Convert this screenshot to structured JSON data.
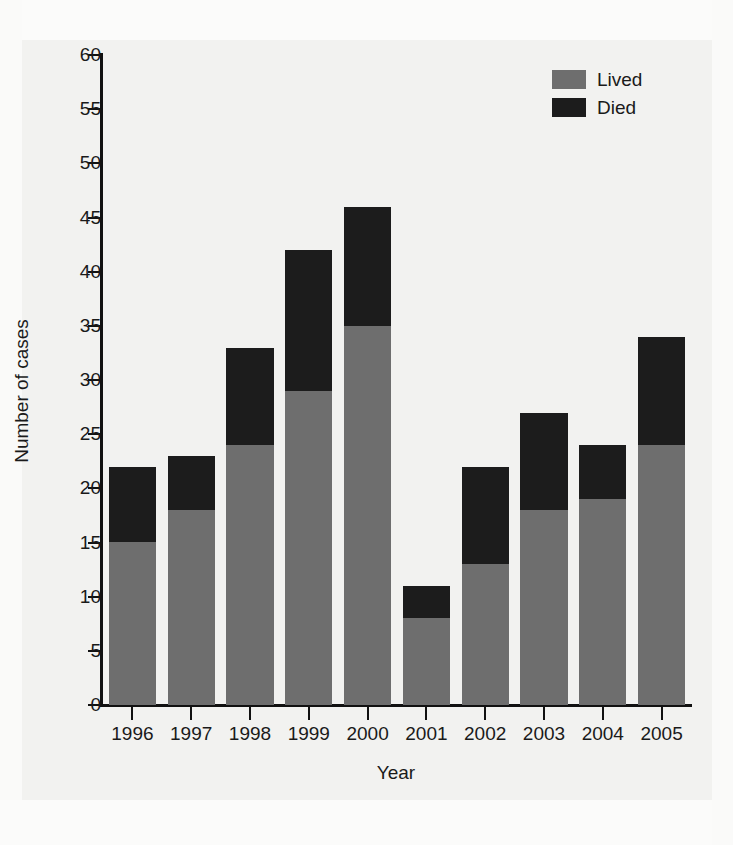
{
  "chart_data": {
    "type": "bar",
    "stacked": true,
    "title": "",
    "xlabel": "Year",
    "ylabel": "Number of cases",
    "categories": [
      "1996",
      "1997",
      "1998",
      "1999",
      "2000",
      "2001",
      "2002",
      "2003",
      "2004",
      "2005"
    ],
    "series": [
      {
        "name": "Lived",
        "color": "#6e6e6e",
        "values": [
          15,
          18,
          24,
          29,
          35,
          8,
          13,
          18,
          19,
          24
        ]
      },
      {
        "name": "Died",
        "color": "#1c1c1c",
        "values": [
          7,
          5,
          9,
          13,
          11,
          3,
          9,
          9,
          5,
          10
        ]
      }
    ],
    "totals": [
      22,
      23,
      33,
      42,
      46,
      11,
      22,
      27,
      24,
      34
    ],
    "ylim": [
      0,
      60
    ],
    "yticks": [
      0,
      5,
      10,
      15,
      20,
      25,
      30,
      35,
      40,
      45,
      50,
      55,
      60
    ],
    "ytick_labels": [
      "0",
      "5",
      "10",
      "15",
      "20",
      "25",
      "30",
      "35",
      "40",
      "45",
      "50",
      "55",
      "60"
    ],
    "grid": false,
    "legend_position": "top-right",
    "legend_entries": [
      "Lived",
      "Died"
    ]
  },
  "colors": {
    "lived": "#6e6e6e",
    "died": "#1c1c1c",
    "axis": "#111111",
    "text": "#1a1a1a",
    "background": "#f2f2f0"
  }
}
